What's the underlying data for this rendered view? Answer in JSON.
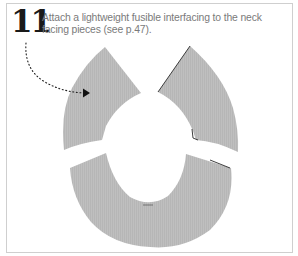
{
  "step": {
    "number": "11",
    "text_line_1": "Attach a lightweight fusible interfacing to the neck",
    "text_line_2": "facing pieces (see p.47)."
  },
  "illustration": {
    "pieces": [
      "left-neck-facing-piece",
      "right-neck-facing-piece",
      "back-neck-facing-piece"
    ],
    "fabric_color": "#bdbdbd",
    "edge_color": "#2a2a2a",
    "arrow_color": "#111111"
  },
  "colors": {
    "frame_border": "#cfcfcf",
    "text": "#7a7a7a",
    "number": "#1a1a1a",
    "background": "#ffffff"
  }
}
